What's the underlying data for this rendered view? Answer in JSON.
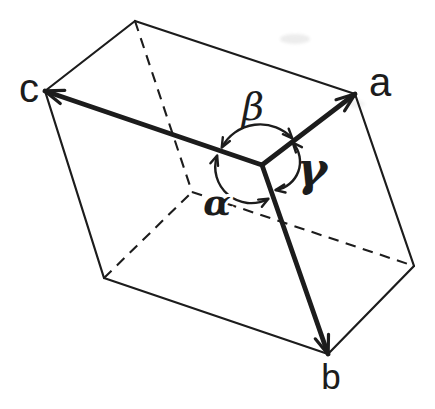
{
  "diagram": {
    "name": "unit-cell",
    "ink_color": "#1c1c1c",
    "background_color": "#ffffff",
    "axis_labels": {
      "a": "a",
      "b": "b",
      "c": "c"
    },
    "angle_labels": {
      "alpha": "α",
      "beta": "β",
      "gamma": "γ"
    },
    "geometry": {
      "vertices": {
        "origin": [
          262,
          165
        ],
        "a_tip": [
          355,
          94
        ],
        "b_tip": [
          328,
          354
        ],
        "c_tip": [
          45,
          91
        ],
        "top": [
          135,
          21
        ],
        "right": [
          414,
          266
        ],
        "bottom_left": [
          104,
          278
        ],
        "hidden": [
          192,
          192
        ]
      },
      "solid_edges": [
        [
          "top",
          "a_tip"
        ],
        [
          "top",
          "c_tip"
        ],
        [
          "c_tip",
          "bottom_left"
        ],
        [
          "bottom_left",
          "b_tip"
        ],
        [
          "b_tip",
          "right"
        ],
        [
          "right",
          "a_tip"
        ]
      ],
      "hidden_edges": [
        [
          "top",
          "hidden"
        ],
        [
          "bottom_left",
          "hidden"
        ],
        [
          "hidden",
          "right"
        ]
      ],
      "axis_vectors": [
        {
          "name": "a",
          "from": "origin",
          "to": "a_tip"
        },
        {
          "name": "c",
          "from": "origin",
          "to": "c_tip"
        },
        {
          "name": "b",
          "from": "origin",
          "to": "b_tip"
        }
      ],
      "angle_arcs": [
        {
          "name": "beta",
          "path": "M 222 147 A 43.7 43.7 0 0 1 292 138"
        },
        {
          "name": "gamma",
          "path": "M 293 143 A 28.6 28.6 0 0 1 276 190"
        },
        {
          "name": "alpha",
          "path": "M 217 156 A 36 36 0 0 0 268 199"
        }
      ],
      "label_positions": {
        "label_a": [
          380,
          82
        ],
        "label_b": [
          331,
          376
        ],
        "label_c": [
          29,
          88
        ],
        "label_alpha": [
          217,
          202
        ],
        "label_beta": [
          253,
          107
        ],
        "label_gamma": [
          312,
          169
        ]
      }
    }
  }
}
